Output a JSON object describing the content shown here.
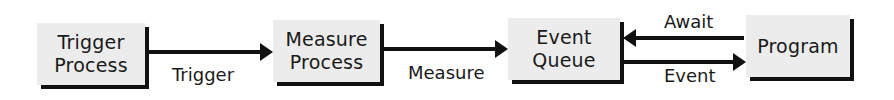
{
  "nodes": [
    {
      "id": "trigger-process",
      "lines": [
        "Trigger",
        "Process"
      ]
    },
    {
      "id": "measure-process",
      "lines": [
        "Measure",
        "Process"
      ]
    },
    {
      "id": "event-queue",
      "lines": [
        "Event",
        "Queue"
      ]
    },
    {
      "id": "program",
      "lines": [
        "Program"
      ]
    }
  ],
  "edges": [
    {
      "from": "trigger-process",
      "to": "measure-process",
      "label": "Trigger"
    },
    {
      "from": "measure-process",
      "to": "event-queue",
      "label": "Measure"
    },
    {
      "from": "program",
      "to": "event-queue",
      "label": "Await"
    },
    {
      "from": "event-queue",
      "to": "program",
      "label": "Event"
    }
  ],
  "colors": {
    "box_fill": "#ececec",
    "stroke": "#111111",
    "text": "#1a1a1a"
  }
}
